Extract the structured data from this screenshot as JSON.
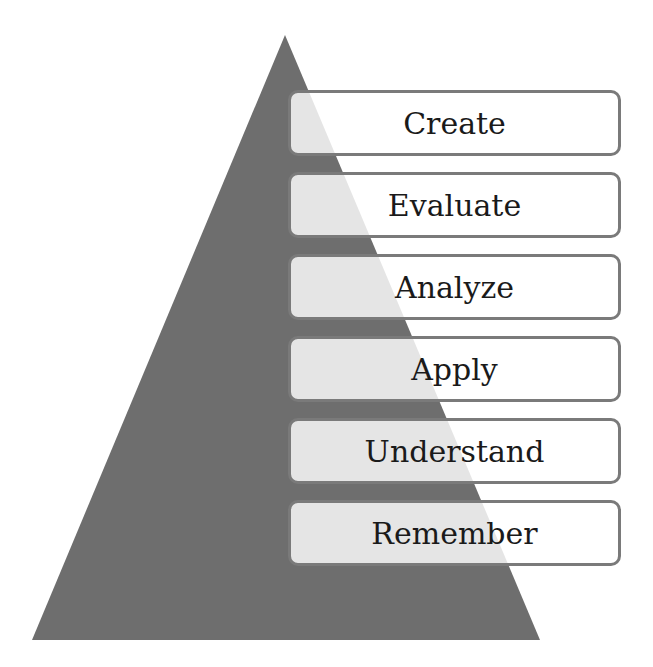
{
  "diagram": {
    "title": "",
    "type": "pyramid",
    "triangle_color": "#6e6e6e",
    "levels": [
      {
        "label": "Create",
        "top": 90
      },
      {
        "label": "Evaluate",
        "top": 172
      },
      {
        "label": "Analyze",
        "top": 254
      },
      {
        "label": "Apply",
        "top": 336
      },
      {
        "label": "Understand",
        "top": 418
      },
      {
        "label": "Remember",
        "top": 500
      }
    ]
  }
}
